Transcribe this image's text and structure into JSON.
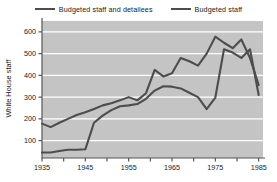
{
  "chart_data": {
    "type": "line",
    "title": "",
    "xlabel": "",
    "ylabel": "White House staff",
    "xlim": [
      1935,
      1986
    ],
    "ylim": [
      20,
      650
    ],
    "yticks": [
      100,
      200,
      300,
      400,
      500,
      600
    ],
    "ytick_labels": [
      "100",
      "200",
      "300",
      "400",
      "500",
      "600"
    ],
    "xticks": [
      1935,
      1940,
      1945,
      1950,
      1955,
      1960,
      1965,
      1970,
      1975,
      1980,
      1985
    ],
    "xtick_labels": [
      "1935",
      "",
      "1945",
      "",
      "1955",
      "",
      "1965",
      "",
      "1975",
      "",
      "1985"
    ],
    "grid": "horizontal",
    "grid_color": "#ffffff",
    "plot_background": "#c4c4c4",
    "legend_position": "top-center",
    "series": [
      {
        "name": "Budgeted staff and detailees",
        "color": "#4d4d4d",
        "x": [
          1935,
          1937,
          1939,
          1941,
          1943,
          1945,
          1947,
          1949,
          1951,
          1953,
          1955,
          1957,
          1959,
          1961,
          1963,
          1965,
          1967,
          1969,
          1971,
          1973,
          1975,
          1977,
          1979,
          1981,
          1983,
          1985
        ],
        "values": [
          178,
          162,
          182,
          200,
          218,
          230,
          245,
          262,
          272,
          285,
          300,
          285,
          318,
          425,
          395,
          410,
          480,
          465,
          445,
          500,
          578,
          550,
          525,
          565,
          480,
          355
        ]
      },
      {
        "name": "Budgeted staff",
        "color": "#4d4d4d",
        "x": [
          1935,
          1937,
          1939,
          1941,
          1943,
          1945,
          1947,
          1949,
          1951,
          1953,
          1955,
          1957,
          1959,
          1961,
          1963,
          1965,
          1967,
          1969,
          1971,
          1973,
          1975,
          1977,
          1979,
          1981,
          1983,
          1985
        ],
        "values": [
          45,
          45,
          52,
          58,
          58,
          60,
          182,
          215,
          240,
          258,
          262,
          268,
          292,
          330,
          350,
          348,
          340,
          320,
          300,
          245,
          298,
          520,
          505,
          480,
          520,
          310
        ]
      }
    ],
    "annotations": []
  },
  "legend": {
    "entries": [
      {
        "label": "Budgeted staff and detailees"
      },
      {
        "label": "Budgeted staff"
      }
    ]
  },
  "axis": {
    "y_title": "White House staff"
  }
}
